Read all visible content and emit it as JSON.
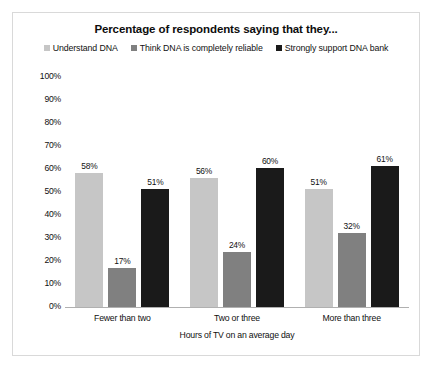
{
  "chart_data": {
    "type": "bar",
    "title": "Percentage of respondents saying that they...",
    "xlabel": "Hours of TV on an average day",
    "ylabel": "",
    "categories": [
      "Fewer than two",
      "Two or three",
      "More than three"
    ],
    "series": [
      {
        "name": "Understand DNA",
        "color": "#c6c6c6",
        "values": [
          58,
          56,
          51
        ],
        "labels": [
          "58%",
          "56%",
          "51%"
        ]
      },
      {
        "name": "Think DNA is completely reliable",
        "color": "#808080",
        "values": [
          17,
          24,
          32
        ],
        "labels": [
          "17%",
          "24%",
          "32%"
        ]
      },
      {
        "name": "Strongly support DNA bank",
        "color": "#1a1a1a",
        "values": [
          51,
          60,
          61
        ],
        "labels": [
          "51%",
          "60%",
          "61%"
        ]
      }
    ],
    "ylim": [
      0,
      100
    ],
    "yticks": [
      "100%",
      "90%",
      "80%",
      "70%",
      "60%",
      "50%",
      "40%",
      "30%",
      "20%",
      "10%",
      "0%"
    ],
    "ytick_values": [
      100,
      90,
      80,
      70,
      60,
      50,
      40,
      30,
      20,
      10,
      0
    ],
    "grid": false,
    "legend_position": "top",
    "value_suffix": "%"
  }
}
